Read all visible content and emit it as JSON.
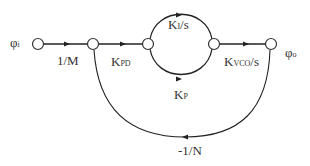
{
  "diagram": {
    "type": "signal-flow-graph",
    "title": "",
    "nodes": [
      {
        "id": "n1",
        "label": "φi",
        "base": "φ",
        "sub": "i",
        "x": 38,
        "y": 44
      },
      {
        "id": "n2",
        "label": "",
        "x": 93,
        "y": 44
      },
      {
        "id": "n3",
        "label": "",
        "x": 148,
        "y": 44
      },
      {
        "id": "n4",
        "label": "",
        "x": 214,
        "y": 44
      },
      {
        "id": "n5",
        "label": "φo",
        "base": "φ",
        "sub": "o",
        "x": 271,
        "y": 44
      }
    ],
    "edges": [
      {
        "from": "n1",
        "to": "n2",
        "gain": "1/M",
        "base": "1/M",
        "sub": ""
      },
      {
        "from": "n2",
        "to": "n3",
        "gain": "KPD",
        "base": "K",
        "sub": "PD"
      },
      {
        "from": "n3",
        "to": "n4",
        "gain": "KI/s",
        "base": "K",
        "sub": "I",
        "suffix": "/s",
        "path": "upper-arc"
      },
      {
        "from": "n3",
        "to": "n4",
        "gain": "KP",
        "base": "K",
        "sub": "P",
        "path": "lower-arc"
      },
      {
        "from": "n4",
        "to": "n5",
        "gain": "KVCO/s",
        "base": "K",
        "sub": "VCO",
        "suffix": "/s"
      },
      {
        "from": "n5",
        "to": "n2",
        "gain": "-1/N",
        "base": "-1/N",
        "sub": "",
        "path": "feedback-loop"
      }
    ],
    "colors": {
      "line": "#222222",
      "node_fill": "#ffffff",
      "text": "#333333"
    }
  }
}
